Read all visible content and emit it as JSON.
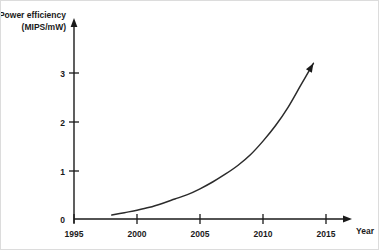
{
  "chart_data": {
    "type": "line",
    "title": "",
    "subtitle": "",
    "xlabel": "Year",
    "ylabel": "Power efficiency",
    "ylabel_units": "(MIPS/mW)",
    "ylabel_line1": "Power efficiency",
    "ylabel_line2": "(MIPS/mW)",
    "x": [
      1998,
      1999,
      2000,
      2001,
      2002,
      2003,
      2004,
      2005,
      2006,
      2007,
      2008,
      2009,
      2010,
      2011,
      2012,
      2013,
      2014
    ],
    "values": [
      0.08,
      0.13,
      0.18,
      0.24,
      0.32,
      0.41,
      0.5,
      0.62,
      0.76,
      0.92,
      1.1,
      1.32,
      1.6,
      1.92,
      2.3,
      2.75,
      3.2
    ],
    "series": [
      {
        "name": "Power efficiency",
        "values": [
          0.08,
          0.13,
          0.18,
          0.24,
          0.32,
          0.41,
          0.5,
          0.62,
          0.76,
          0.92,
          1.1,
          1.32,
          1.6,
          1.92,
          2.3,
          2.75,
          3.2
        ],
        "color": "#2b2b2b"
      }
    ],
    "xticks": [
      1995,
      2000,
      2005,
      2010,
      2015
    ],
    "xtick_labels": [
      "1995",
      "2000",
      "2005",
      "2010",
      "2015"
    ],
    "yticks": [
      0,
      1,
      2,
      3
    ],
    "ytick_labels": [
      "0",
      "1",
      "2",
      "3"
    ],
    "xlim": [
      1995,
      2017
    ],
    "ylim": [
      0,
      3.55
    ],
    "grid": false,
    "legend": "none",
    "axis_arrows": [
      "x-axis-right",
      "y-axis-up"
    ],
    "curve_arrow_end": true,
    "annotations": []
  },
  "axis": {
    "y_title_line1": "Power efficiency",
    "y_title_line2": "(MIPS/mW)",
    "x_title": "Year"
  },
  "ticks": {
    "y": [
      "3",
      "2",
      "1",
      "0"
    ],
    "x": [
      "1995",
      "2000",
      "2005",
      "2010",
      "2015"
    ]
  },
  "colors": {
    "curve": "#2b2b2b",
    "axis": "#1a1a1a",
    "background": "#ffffff",
    "border": "#dcdcdc"
  }
}
